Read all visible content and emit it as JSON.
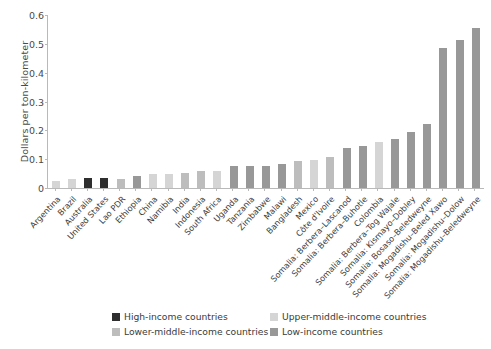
{
  "chart_data": {
    "type": "bar",
    "title": "",
    "subtitle": "",
    "xlabel": "",
    "ylabel": "Dollars per ton-kilometer",
    "ylim": [
      0,
      0.6
    ],
    "ytick_labels": [
      "0.6",
      "0.5",
      "0.4",
      "0.3",
      "0.2",
      "0.1",
      "0"
    ],
    "ytick_values": [
      0.6,
      0.5,
      0.4,
      0.3,
      0.2,
      0.1,
      0
    ],
    "grid": false,
    "legend_position": "bottom",
    "categories": [
      "Argentina",
      "Brazil",
      "Australia",
      "United States",
      "Lao PDR",
      "Ethiopia",
      "China",
      "Namibia",
      "India",
      "Indonesia",
      "South Africa",
      "Uganda",
      "Tanzania",
      "Zimbabwe",
      "Malawi",
      "Bangladesh",
      "Mexico",
      "Côte d'Ivoire",
      "Somalia: Berbera–Lascanod",
      "Somalia: Berbera–Buhotle",
      "Colombia",
      "Somalia: Berbera–Tog Wajale",
      "Somalia: Kismayo–Dobley",
      "Somalia: Bosaso–Beledweyne",
      "Somalia: Mogadishu–Beled Xawo",
      "Somalia: Mogadishu–Dolow",
      "Somalia: Mogadishu–Beledweyne"
    ],
    "values": [
      0.026,
      0.032,
      0.035,
      0.035,
      0.033,
      0.043,
      0.048,
      0.049,
      0.053,
      0.059,
      0.059,
      0.078,
      0.078,
      0.077,
      0.083,
      0.092,
      0.098,
      0.108,
      0.14,
      0.145,
      0.16,
      0.17,
      0.195,
      0.222,
      0.485,
      0.515,
      0.556
    ],
    "groups": [
      "upper-middle",
      "upper-middle",
      "high",
      "high",
      "lower-middle",
      "low",
      "upper-middle",
      "upper-middle",
      "lower-middle",
      "lower-middle",
      "upper-middle",
      "low",
      "low",
      "low",
      "low",
      "lower-middle",
      "upper-middle",
      "lower-middle",
      "low",
      "low",
      "upper-middle",
      "low",
      "low",
      "low",
      "low",
      "low",
      "low"
    ]
  },
  "legend": {
    "items": [
      {
        "label": "High-income countries",
        "group": "high",
        "color": "#2e2e2e"
      },
      {
        "label": "Upper-middle-income countries",
        "group": "upper-middle",
        "color": "#d5d5d5"
      },
      {
        "label": "Lower-middle-income countries",
        "group": "lower-middle",
        "color": "#bdbdbd"
      },
      {
        "label": "Low-income countries",
        "group": "low",
        "color": "#989898"
      }
    ]
  },
  "colors": {
    "high": "#2e2e2e",
    "upper-middle": "#d5d5d5",
    "lower-middle": "#bdbdbd",
    "low": "#989898",
    "axis": "#b9b9b9",
    "text": "#3a3a3a",
    "background": "#ffffff"
  }
}
